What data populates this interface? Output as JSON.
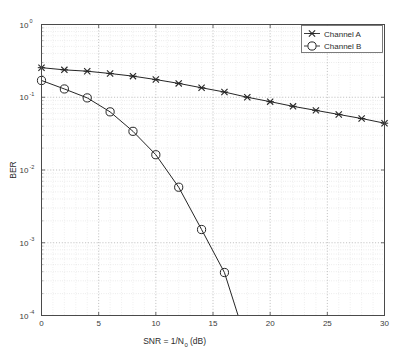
{
  "chart_data": {
    "type": "line",
    "title": "",
    "xlabel": "SNR = 1/N_0 (dB)",
    "xlabel_main": "SNR = 1/N",
    "xlabel_sub": "0",
    "xlabel_units": "(dB)",
    "ylabel": "BER",
    "xscale": "linear",
    "yscale": "log",
    "xlim": [
      0,
      30
    ],
    "ylim": [
      0.0001,
      1
    ],
    "xticks": [
      0,
      5,
      10,
      15,
      20,
      25,
      30
    ],
    "xtick_labels": [
      "0",
      "5",
      "10",
      "15",
      "20",
      "25",
      "30"
    ],
    "yticks": [
      1,
      0.1,
      0.01,
      0.001,
      0.0001
    ],
    "ytick_labels": [
      "10^0",
      "10^-1",
      "10^-2",
      "10^-3",
      "10^-4"
    ],
    "ytick_mantissa": "10",
    "ytick_exponents": [
      "0",
      "-1",
      "-2",
      "-3",
      "-4"
    ],
    "grid": true,
    "grid_minor": true,
    "grid_style": "dotted",
    "legend_position": "upper right",
    "x": [
      0,
      2,
      4,
      6,
      8,
      10,
      12,
      14,
      16,
      18,
      20,
      22,
      24,
      26,
      28,
      30
    ],
    "series": [
      {
        "name": "Channel A",
        "marker": "x-marker",
        "color": "#262626",
        "values": [
          0.255,
          0.238,
          0.228,
          0.212,
          0.195,
          0.175,
          0.155,
          0.135,
          0.118,
          0.1,
          0.087,
          0.075,
          0.066,
          0.058,
          0.051,
          0.044
        ]
      },
      {
        "name": "Channel B",
        "marker": "circle-marker",
        "color": "#262626",
        "values": [
          0.17,
          0.13,
          0.098,
          0.063,
          0.034,
          0.0162,
          0.0058,
          0.00152,
          0.00039,
          4e-05,
          null,
          null,
          null,
          null,
          null,
          null
        ]
      }
    ]
  },
  "legend": {
    "entries": [
      {
        "label": "Channel A",
        "marker": "x-marker"
      },
      {
        "label": "Channel B",
        "marker": "circle-marker"
      }
    ]
  },
  "colors": {
    "axis": "#4a4a4a",
    "grid": "#c8c8c8",
    "line": "#262626",
    "background": "#ffffff",
    "legend_border": "#6e6e6e"
  }
}
